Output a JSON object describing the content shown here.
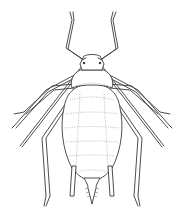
{
  "illustration": {
    "subject": "aphid",
    "style": "line-drawing",
    "view": "dorsal",
    "ink_color": "#3a3a3a",
    "background": "#ffffff",
    "parts": [
      "antenna-left",
      "antenna-right",
      "head",
      "thorax",
      "abdomen",
      "leg-front-left",
      "leg-front-right",
      "leg-mid-left",
      "leg-mid-right",
      "leg-hind-left",
      "leg-hind-right",
      "siphunculus-left",
      "siphunculus-right",
      "cauda"
    ]
  }
}
